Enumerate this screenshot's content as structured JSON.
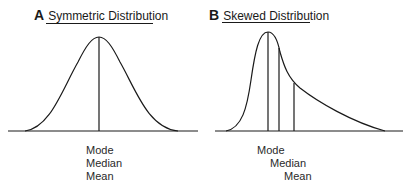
{
  "panels": [
    {
      "letter": "A",
      "title": "Symmetric Distribution",
      "labels": [
        "Mode",
        "Median",
        "Mean"
      ]
    },
    {
      "letter": "B",
      "title": "Skewed Distribution",
      "labels": [
        "Mode",
        "Median",
        "Mean"
      ]
    }
  ],
  "colors": {
    "ink": "#1a1a1a",
    "background": "#ffffff"
  }
}
